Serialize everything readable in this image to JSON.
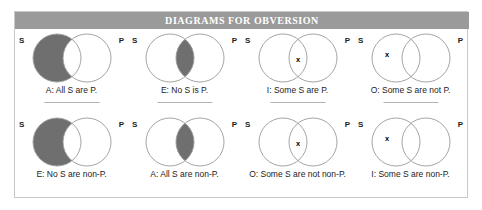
{
  "figure": {
    "title": "DIAGRAMS FOR OBVERSION",
    "colors": {
      "header_bar": "#9a9a9a",
      "header_text": "#ffffff",
      "panel_border": "#c9c9c9",
      "circle_stroke": "#9a9a9a",
      "shade_fill": "#6f6f6f",
      "divider": "#b3b3b3",
      "caption_text": "#1b1b1b"
    }
  },
  "rows": [
    {
      "name": "original-propositions",
      "cells": [
        {
          "left_label": "S",
          "right_label": "P",
          "caption": "A: All S are P.",
          "shade": "left-only",
          "x_mark": "none",
          "x_label": ""
        },
        {
          "left_label": "S",
          "right_label": "P",
          "caption": "E: No S is P.",
          "shade": "intersection",
          "x_mark": "none",
          "x_label": ""
        },
        {
          "left_label": "S",
          "right_label": "P",
          "caption": "I: Some S are P.",
          "shade": "none",
          "x_mark": "intersection",
          "x_label": "x"
        },
        {
          "left_label": "S",
          "right_label": "P",
          "caption": "O: Some S are not P.",
          "shade": "none",
          "x_mark": "left-only",
          "x_label": "x"
        }
      ]
    },
    {
      "name": "obverted-propositions",
      "cells": [
        {
          "left_label": "S",
          "right_label": "P",
          "caption": "E: No S are non-P.",
          "shade": "left-only",
          "x_mark": "none",
          "x_label": ""
        },
        {
          "left_label": "S",
          "right_label": "P",
          "caption": "A: All S are non-P.",
          "shade": "intersection",
          "x_mark": "none",
          "x_label": ""
        },
        {
          "left_label": "S",
          "right_label": "P",
          "caption": "O: Some S are not non-P.",
          "shade": "none",
          "x_mark": "intersection",
          "x_label": "x"
        },
        {
          "left_label": "S",
          "right_label": "P",
          "caption": "I: Some S are non-P.",
          "shade": "none",
          "x_mark": "left-only",
          "x_label": "x"
        }
      ]
    }
  ]
}
